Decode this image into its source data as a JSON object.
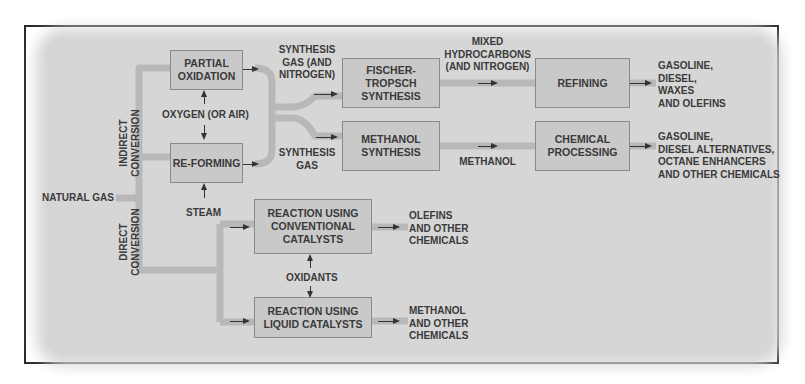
{
  "diagram": {
    "colors": {
      "frame": "#2a2a2a",
      "background": "#d6d6d6",
      "box": "#c9c9c9",
      "pipe": "#bfbfbf",
      "text": "#3a3a3a"
    },
    "input": {
      "label": "NATURAL GAS"
    },
    "sections": {
      "indirect": {
        "line1": "INDIRECT",
        "line2": "CONVERSION"
      },
      "direct": {
        "line1": "DIRECT",
        "line2": "CONVERSION"
      }
    },
    "boxes": {
      "partial_oxidation": {
        "line1": "PARTIAL",
        "line2": "OXIDATION"
      },
      "reforming": {
        "line1": "RE-FORMING"
      },
      "fischer_tropsch": {
        "line1": "FISCHER-",
        "line2": "TROPSCH",
        "line3": "SYNTHESIS"
      },
      "methanol_synthesis": {
        "line1": "METHANOL",
        "line2": "SYNTHESIS"
      },
      "refining": {
        "line1": "REFINING"
      },
      "chemical_processing": {
        "line1": "CHEMICAL",
        "line2": "PROCESSING"
      },
      "reaction_conventional": {
        "line1": "REACTION USING",
        "line2": "CONVENTIONAL",
        "line3": "CATALYSTS"
      },
      "reaction_liquid": {
        "line1": "REACTION USING",
        "line2": "LIQUID CATALYSTS"
      }
    },
    "inputs_labels": {
      "oxygen": "OXYGEN (OR AIR)",
      "steam": "STEAM",
      "oxidants": "OXIDANTS"
    },
    "flow_labels": {
      "syngas_nitrogen": {
        "line1": "SYNTHESIS",
        "line2": "GAS (AND",
        "line3": "NITROGEN)"
      },
      "syngas": {
        "line1": "SYNTHESIS",
        "line2": "GAS"
      },
      "mixed_hydrocarbons": {
        "line1": "MIXED",
        "line2": "HYDROCARBONS",
        "line3": "(AND NITROGEN)"
      },
      "methanol": "METHANOL"
    },
    "outputs": {
      "refining": [
        "GASOLINE,",
        "DIESEL,",
        "WAXES",
        "AND OLEFINS"
      ],
      "chemical": [
        "GASOLINE,",
        "DIESEL ALTERNATIVES,",
        "OCTANE ENHANCERS",
        "AND OTHER CHEMICALS"
      ],
      "conventional": [
        "OLEFINS",
        "AND OTHER",
        "CHEMICALS"
      ],
      "liquid": [
        "METHANOL",
        "AND OTHER",
        "CHEMICALS"
      ]
    }
  }
}
